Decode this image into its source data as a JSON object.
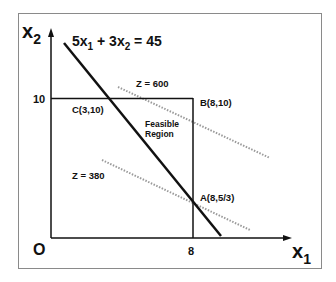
{
  "diagram": {
    "axes": {
      "x_label": "x",
      "x_subscript": "1",
      "y_label": "x",
      "y_subscript": "2",
      "origin_label": "O",
      "x_tick": "8",
      "y_tick": "10"
    },
    "constraint": {
      "equation_parts": [
        "5x",
        "1",
        " + 3x",
        "2",
        " = 45"
      ]
    },
    "points": {
      "A": "A(8,5/3)",
      "B": "B(8,10)",
      "C": "C(3,10)"
    },
    "region": {
      "line1": "Feasible",
      "line2": "Region"
    },
    "isoprofit_lines": [
      {
        "label": "Z = 600"
      },
      {
        "label": "Z = 380"
      }
    ],
    "colors": {
      "line": "#111111",
      "dotted": "#9a9a9a",
      "frame": "#888888"
    }
  }
}
